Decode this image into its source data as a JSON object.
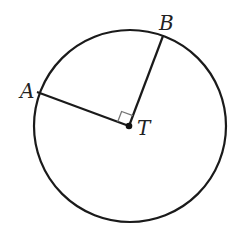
{
  "figure": {
    "type": "circle-with-radii",
    "circle": {
      "cx": 130,
      "cy": 126,
      "r": 96,
      "stroke": "#1a1a1a",
      "stroke_width": 2.2
    },
    "center": {
      "name": "T",
      "x": 129,
      "y": 126
    },
    "points": [
      {
        "name": "A",
        "x": 37,
        "y": 92
      },
      {
        "name": "B",
        "x": 163,
        "y": 36
      }
    ],
    "segments": [
      {
        "from": "T",
        "to": "A",
        "label": "radius TA"
      },
      {
        "from": "T",
        "to": "B",
        "label": "radius TB"
      }
    ],
    "right_angle_marker": {
      "at": "T",
      "between": [
        "A",
        "B"
      ],
      "color": "#777777"
    },
    "labels": {
      "A": {
        "text": "A",
        "x": 20,
        "y": 98
      },
      "B": {
        "text": "B",
        "x": 159,
        "y": 30
      },
      "T": {
        "text": "T",
        "x": 137,
        "y": 135
      }
    }
  }
}
